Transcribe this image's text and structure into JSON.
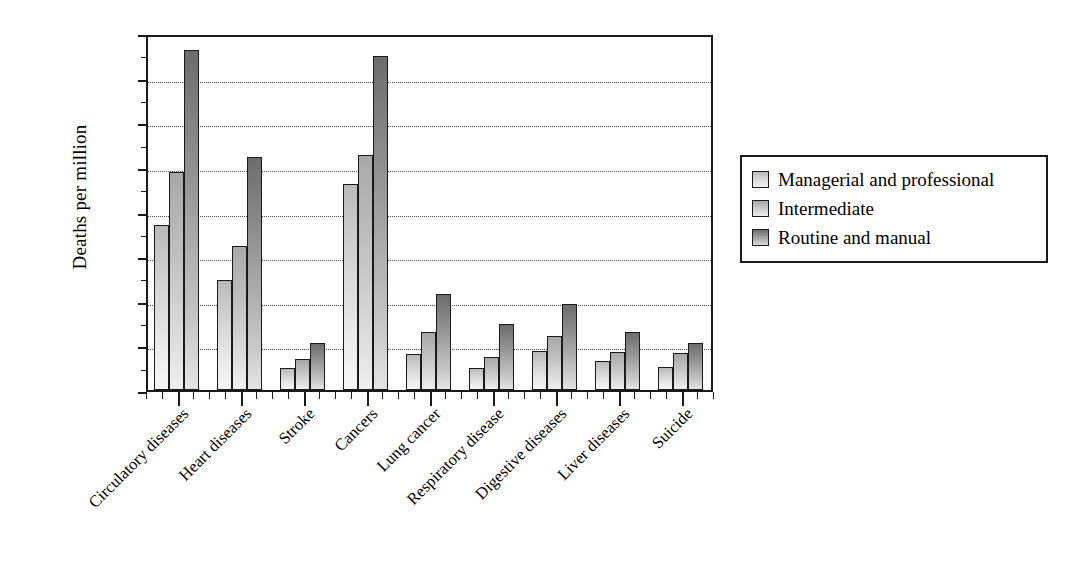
{
  "chart_data": {
    "type": "bar",
    "title": "",
    "subtitle": "",
    "xlabel": "",
    "ylabel": "Deaths per million",
    "ylim": [
      0,
      1600
    ],
    "ytick_step": 200,
    "yticks": [
      0,
      200,
      400,
      600,
      800,
      1000,
      1200,
      1400,
      1600
    ],
    "ytick_labels": [
      "0",
      "200",
      "400",
      "600",
      "800",
      "1000",
      "1200",
      "1400",
      "1600"
    ],
    "grid": "horizontal-dotted",
    "legend_position": "right",
    "categories": [
      "Circulatory diseases",
      "Heart diseases",
      "Stroke",
      "Cancers",
      "Lung cancer",
      "Respiratory disease",
      "Digestive diseases",
      "Liver diseases",
      "Suicide"
    ],
    "series": [
      {
        "name": "Managerial and professional",
        "color": "#cfcfcf",
        "values": [
          740,
          495,
          100,
          925,
          160,
          100,
          175,
          130,
          105
        ]
      },
      {
        "name": "Intermediate",
        "color": "#bdbdbd",
        "values": [
          975,
          645,
          140,
          1055,
          260,
          150,
          240,
          170,
          165
        ]
      },
      {
        "name": "Routine and manual",
        "color": "#8c8c8c",
        "values": [
          1525,
          1045,
          210,
          1495,
          430,
          295,
          385,
          260,
          210
        ]
      }
    ]
  },
  "legend": {
    "items": [
      {
        "label": "Managerial and professional"
      },
      {
        "label": "Intermediate"
      },
      {
        "label": "Routine and manual"
      }
    ]
  },
  "axis": {
    "y_title": "Deaths per million"
  }
}
